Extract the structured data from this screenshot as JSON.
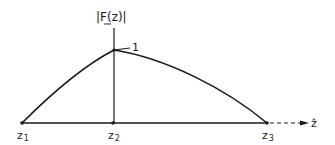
{
  "diagram": {
    "y_axis_label": "|F(z)|",
    "x_axis_label": "ẑ",
    "peak_label": "1",
    "points": [
      {
        "name": "z1",
        "label": "z",
        "sub": "1"
      },
      {
        "name": "z2",
        "label": "z",
        "sub": "2"
      },
      {
        "name": "z3",
        "label": "z",
        "sub": "3"
      }
    ]
  },
  "colors": {
    "ink": "#1a1a1a",
    "background": "#ffffff"
  }
}
